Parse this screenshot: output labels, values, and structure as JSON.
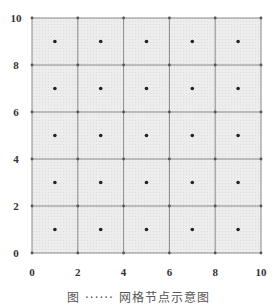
{
  "chart_data": {
    "type": "scatter",
    "title": "",
    "xlabel": "",
    "ylabel": "",
    "xlim": [
      0,
      10
    ],
    "ylim": [
      0,
      10
    ],
    "grid": true,
    "grid_step": 2,
    "x_ticks": [
      "0",
      "2",
      "4",
      "6",
      "8",
      "10"
    ],
    "y_ticks": [
      "0",
      "2",
      "4",
      "6",
      "8",
      "10"
    ],
    "series": [
      {
        "name": "cell centers",
        "points": [
          [
            1,
            1
          ],
          [
            3,
            1
          ],
          [
            5,
            1
          ],
          [
            7,
            1
          ],
          [
            9,
            1
          ],
          [
            1,
            3
          ],
          [
            3,
            3
          ],
          [
            5,
            3
          ],
          [
            7,
            3
          ],
          [
            9,
            3
          ],
          [
            1,
            5
          ],
          [
            3,
            5
          ],
          [
            5,
            5
          ],
          [
            7,
            5
          ],
          [
            9,
            5
          ],
          [
            1,
            7
          ],
          [
            3,
            7
          ],
          [
            5,
            7
          ],
          [
            7,
            7
          ],
          [
            9,
            7
          ],
          [
            1,
            9
          ],
          [
            3,
            9
          ],
          [
            5,
            9
          ],
          [
            7,
            9
          ],
          [
            9,
            9
          ]
        ]
      }
    ],
    "colors": {
      "fill": "#ececec",
      "grid_line": "#8a8a8a",
      "point": "#222222"
    }
  },
  "caption": "图 ······ 网格节点示意图"
}
